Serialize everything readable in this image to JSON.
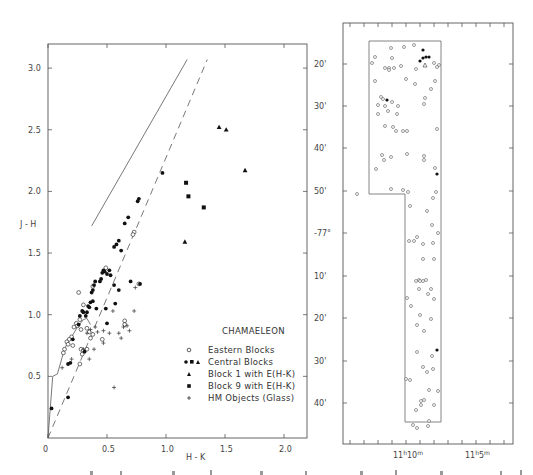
{
  "chart_data": [
    {
      "type": "scatter",
      "title": "CHAMAELEON",
      "xlabel": "H - K",
      "ylabel": "J - H",
      "xlim": [
        0,
        2.2
      ],
      "ylim": [
        0,
        3.2
      ],
      "xticks": [
        "0",
        "0.5",
        "1.0",
        "1.5",
        "2.0"
      ],
      "yticks": [
        "0.5",
        "1.0",
        "1.5",
        "2.0",
        "2.5",
        "3.0"
      ],
      "grid": false,
      "legend_position": "lower right",
      "legend": [
        {
          "marker": "open-circle",
          "label": "Eastern Blocks"
        },
        {
          "marker": "filled-circle-square-triangle",
          "label": "Central Blocks"
        },
        {
          "marker": "filled-triangle",
          "label": "Block 1 with  E(H-K)"
        },
        {
          "marker": "filled-square",
          "label": "Block 9 with  E(H-K)"
        },
        {
          "marker": "plus",
          "label": "HM Objects (Glass)"
        }
      ],
      "lines": [
        {
          "name": "reddening line (solid)",
          "style": "solid",
          "points": [
            [
              0.37,
              1.72
            ],
            [
              1.18,
              3.07
            ]
          ]
        },
        {
          "name": "reddening line (dashed)",
          "style": "dashed",
          "points": [
            [
              0.0,
              0.0
            ],
            [
              1.35,
              3.07
            ]
          ]
        },
        {
          "name": "intrinsic colour locus",
          "style": "solid",
          "points": [
            [
              0.0,
              0.0
            ],
            [
              0.04,
              0.5
            ],
            [
              0.08,
              0.52
            ],
            [
              0.14,
              0.72
            ],
            [
              0.17,
              0.78
            ],
            [
              0.2,
              0.82
            ],
            [
              0.25,
              0.9
            ],
            [
              0.3,
              0.96
            ],
            [
              0.33,
              0.97
            ],
            [
              0.36,
              0.92
            ]
          ]
        }
      ],
      "series": [
        {
          "name": "Eastern Blocks",
          "marker": "open-circle",
          "points": [
            [
              0.26,
              1.18
            ],
            [
              0.3,
              1.08
            ],
            [
              0.27,
              0.96
            ],
            [
              0.24,
              0.93
            ],
            [
              0.25,
              0.91
            ],
            [
              0.22,
              0.9
            ],
            [
              0.28,
              0.88
            ],
            [
              0.33,
              0.89
            ],
            [
              0.35,
              0.86
            ],
            [
              0.38,
              0.84
            ],
            [
              0.2,
              0.82
            ],
            [
              0.18,
              0.8
            ],
            [
              0.16,
              0.78
            ],
            [
              0.17,
              0.76
            ],
            [
              0.14,
              0.72
            ],
            [
              0.21,
              0.75
            ],
            [
              0.28,
              0.72
            ],
            [
              0.3,
              0.71
            ],
            [
              0.33,
              0.72
            ],
            [
              0.29,
              0.68
            ],
            [
              0.27,
              0.6
            ],
            [
              0.13,
              0.69
            ],
            [
              0.38,
              1.23
            ],
            [
              0.46,
              0.8
            ],
            [
              0.49,
              1.38
            ],
            [
              0.73,
              1.67
            ],
            [
              0.72,
              1.65
            ],
            [
              0.77,
              1.25
            ],
            [
              0.65,
              0.95
            ],
            [
              0.65,
              0.92
            ],
            [
              0.36,
              0.81
            ]
          ]
        },
        {
          "name": "Central Blocks",
          "marker": "filled-circle",
          "points": [
            [
              0.03,
              0.24
            ],
            [
              0.17,
              0.33
            ],
            [
              0.19,
              0.61
            ],
            [
              0.21,
              0.8
            ],
            [
              0.26,
              0.92
            ],
            [
              0.27,
              0.99
            ],
            [
              0.29,
              1.03
            ],
            [
              0.3,
              1.02
            ],
            [
              0.32,
              0.99
            ],
            [
              0.31,
              0.7
            ],
            [
              0.33,
              1.02
            ],
            [
              0.34,
              1.07
            ],
            [
              0.35,
              1.06
            ],
            [
              0.36,
              1.1
            ],
            [
              0.38,
              1.11
            ],
            [
              0.37,
              1.18
            ],
            [
              0.38,
              1.2
            ],
            [
              0.39,
              1.24
            ],
            [
              0.4,
              1.27
            ],
            [
              0.41,
              1.05
            ],
            [
              0.44,
              1.27
            ],
            [
              0.45,
              1.29
            ],
            [
              0.46,
              1.34
            ],
            [
              0.47,
              1.36
            ],
            [
              0.48,
              1.35
            ],
            [
              0.5,
              1.33
            ],
            [
              0.52,
              1.36
            ],
            [
              0.53,
              1.32
            ],
            [
              0.56,
              1.55
            ],
            [
              0.58,
              1.57
            ],
            [
              0.6,
              1.6
            ],
            [
              0.62,
              1.52
            ],
            [
              0.65,
              1.74
            ],
            [
              0.68,
              1.79
            ],
            [
              0.76,
              1.92
            ],
            [
              0.77,
              1.94
            ],
            [
              0.97,
              2.15
            ],
            [
              0.49,
              1.05
            ],
            [
              0.5,
              0.93
            ],
            [
              0.56,
              1.24
            ],
            [
              0.6,
              1.2
            ],
            [
              0.57,
              1.09
            ],
            [
              0.7,
              1.27
            ],
            [
              0.78,
              1.25
            ],
            [
              0.17,
              0.6
            ]
          ]
        },
        {
          "name": "Block 1 with E(H-K)",
          "marker": "filled-triangle",
          "points": [
            [
              1.45,
              2.52
            ],
            [
              1.51,
              2.5
            ],
            [
              1.67,
              2.17
            ],
            [
              1.16,
              1.59
            ]
          ]
        },
        {
          "name": "Block 9 with E(H-K)",
          "marker": "filled-square",
          "points": [
            [
              1.17,
              2.07
            ],
            [
              1.19,
              1.96
            ],
            [
              1.32,
              1.87
            ]
          ]
        },
        {
          "name": "HM Objects (Glass)",
          "marker": "plus",
          "points": [
            [
              0.12,
              0.57
            ],
            [
              0.2,
              0.64
            ],
            [
              0.3,
              0.72
            ],
            [
              0.33,
              0.85
            ],
            [
              0.36,
              0.88
            ],
            [
              0.39,
              0.72
            ],
            [
              0.35,
              0.64
            ],
            [
              0.42,
              0.86
            ],
            [
              0.47,
              0.87
            ],
            [
              0.47,
              0.77
            ],
            [
              0.52,
              0.85
            ],
            [
              0.55,
              1.03
            ],
            [
              0.6,
              0.85
            ],
            [
              0.62,
              0.81
            ],
            [
              0.64,
              0.9
            ],
            [
              0.67,
              0.91
            ],
            [
              0.69,
              0.87
            ],
            [
              0.73,
              1.03
            ],
            [
              0.74,
              1.22
            ],
            [
              0.56,
              0.41
            ],
            [
              0.4,
              0.9
            ]
          ]
        }
      ]
    },
    {
      "type": "scatter",
      "title": "",
      "xlabel": "Right Ascension",
      "ylabel": "Declination",
      "xticks": [
        "11h10m",
        "11h5m"
      ],
      "yticks": [
        "20'",
        "30'",
        "40'",
        "50'",
        "-77°",
        "10'",
        "20'",
        "30'",
        "40'"
      ],
      "grid": false,
      "boundary_polygon": "L-shaped survey region (upper wide block, lower narrow strip)",
      "series": [
        {
          "name": "open circles",
          "marker": "open-circle",
          "count_approx": 95
        },
        {
          "name": "filled circles",
          "marker": "filled-circle",
          "count_approx": 8
        },
        {
          "name": "open triangle",
          "marker": "open-triangle",
          "count_approx": 1
        }
      ]
    }
  ],
  "left_plot": {
    "legend_title": "CHAMAELEON",
    "legend_items": [
      "Eastern Blocks",
      "Central Blocks",
      "Block 1 with  E(H-K)",
      "Block 9 with  E(H-K)",
      "HM Objects (Glass)"
    ],
    "xlabel": "H - K",
    "ylabel": "J - H",
    "xticks": [
      "0",
      "0.5",
      "1.0",
      "1.5",
      "2.0"
    ],
    "yticks": [
      "0.5",
      "1.0",
      "1.5",
      "2.0",
      "2.5",
      "3.0"
    ]
  },
  "right_plot": {
    "yticks": [
      "20'",
      "30'",
      "40'",
      "50'",
      "-77°",
      "10'",
      "20'",
      "30'",
      "40'"
    ],
    "xticks": [
      {
        "h": "11",
        "hsup": "h",
        "m": "10",
        "msup": "m"
      },
      {
        "h": "11",
        "hsup": "h",
        "m": "5",
        "msup": "m"
      }
    ]
  }
}
